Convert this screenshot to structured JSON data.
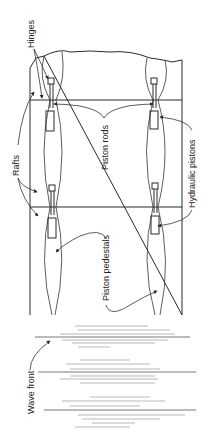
{
  "figure": {
    "labels": {
      "hinges": "Hinges",
      "rafts": "Rafts",
      "piston_rods": "Piston rods",
      "hydraulic_pistons": "Hydraulic pistons",
      "piston_pedestals": "Piston pedestals",
      "wave_front": "Wave front"
    },
    "colors": {
      "ink": "#2a2a2a",
      "wave_lines": "#9a9a9a",
      "background": "#ffffff"
    }
  }
}
